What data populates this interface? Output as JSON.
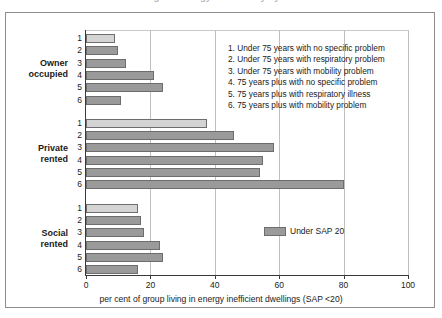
{
  "title": "Figure: energy inefficiency by tenure",
  "chart_data": {
    "type": "bar",
    "orientation": "horizontal",
    "title": "",
    "xlabel": "per cent of group living in energy inefficient dwellings (SAP <20)",
    "ylabel": "",
    "xlim": [
      0,
      100
    ],
    "xticks": [
      "0",
      "20",
      "40",
      "60",
      "80",
      "100"
    ],
    "grid": true,
    "legend_position": "inside-right-lower",
    "series": [
      {
        "name": "Under SAP 20",
        "swatch_color": "#9a9a9a"
      }
    ],
    "category_key": [
      "1. Under 75 years with no specific problem",
      "2. Under 75 years with respiratory problem",
      "3. Under 75 years with mobility problem",
      "4. 75 years plus with no specific problem",
      "5. 75 years plus with respiratory illness",
      "6. 75 years plus with mobility problem"
    ],
    "groups": [
      {
        "label_line1": "Owner",
        "label_line2": "occupied",
        "categories": [
          "1",
          "2",
          "3",
          "4",
          "5",
          "6"
        ],
        "values": [
          9,
          10,
          12.5,
          21,
          24,
          11
        ]
      },
      {
        "label_line1": "Private",
        "label_line2": "rented",
        "categories": [
          "1",
          "2",
          "3",
          "4",
          "5",
          "6"
        ],
        "values": [
          37.5,
          46,
          58.5,
          55,
          54,
          80
        ]
      },
      {
        "label_line1": "Social",
        "label_line2": "rented",
        "categories": [
          "1",
          "2",
          "3",
          "4",
          "5",
          "6"
        ],
        "values": [
          16,
          17,
          18,
          23,
          24,
          16
        ]
      }
    ]
  }
}
